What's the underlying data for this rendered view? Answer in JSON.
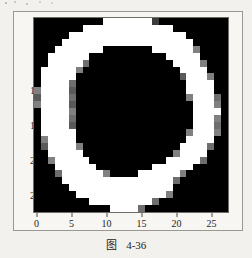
{
  "figure": {
    "caption_symbol": "图",
    "caption_number": "4-36"
  },
  "chart_data": {
    "type": "heatmap",
    "title": "",
    "xlabel": "",
    "ylabel": "",
    "xlim": [
      -0.5,
      27.5
    ],
    "ylim": [
      27.5,
      -0.5
    ],
    "grid": false,
    "legend": "none",
    "colormap": "gray",
    "vmin": 0,
    "vmax": 255,
    "rows": 28,
    "cols": 28,
    "x_ticks": [
      0,
      5,
      10,
      15,
      20,
      25
    ],
    "y_ticks": [
      0,
      5,
      10,
      15,
      20,
      25
    ],
    "x_tick_labels": [
      "0",
      "5",
      "10",
      "15",
      "20",
      "25"
    ],
    "y_tick_labels": [
      "0",
      "5",
      "10",
      "15",
      "20",
      "25"
    ],
    "values": [
      [
        0,
        0,
        0,
        0,
        0,
        0,
        0,
        0,
        0,
        0,
        255,
        255,
        255,
        255,
        255,
        255,
        255,
        60,
        0,
        0,
        0,
        0,
        0,
        0,
        0,
        0,
        0,
        0
      ],
      [
        0,
        0,
        0,
        0,
        0,
        0,
        0,
        255,
        255,
        255,
        255,
        255,
        255,
        255,
        255,
        255,
        255,
        255,
        255,
        255,
        0,
        0,
        0,
        0,
        0,
        0,
        0,
        0
      ],
      [
        0,
        0,
        0,
        0,
        0,
        255,
        255,
        255,
        255,
        255,
        255,
        255,
        255,
        255,
        255,
        255,
        255,
        255,
        255,
        255,
        255,
        255,
        0,
        0,
        0,
        0,
        0,
        0
      ],
      [
        0,
        0,
        0,
        0,
        255,
        255,
        255,
        255,
        255,
        255,
        255,
        255,
        255,
        255,
        255,
        255,
        255,
        255,
        255,
        255,
        255,
        255,
        255,
        0,
        0,
        0,
        0,
        0
      ],
      [
        0,
        0,
        0,
        255,
        255,
        255,
        255,
        255,
        255,
        255,
        0,
        0,
        0,
        0,
        0,
        0,
        0,
        255,
        255,
        255,
        255,
        255,
        255,
        128,
        0,
        0,
        0,
        0
      ],
      [
        0,
        0,
        255,
        255,
        255,
        255,
        255,
        255,
        0,
        0,
        0,
        0,
        0,
        0,
        0,
        0,
        0,
        0,
        0,
        255,
        255,
        255,
        255,
        255,
        0,
        0,
        0,
        0
      ],
      [
        0,
        0,
        255,
        255,
        255,
        255,
        255,
        110,
        0,
        0,
        0,
        0,
        0,
        0,
        0,
        0,
        0,
        0,
        0,
        0,
        255,
        255,
        255,
        255,
        128,
        0,
        0,
        0
      ],
      [
        0,
        255,
        255,
        255,
        255,
        255,
        128,
        0,
        0,
        0,
        0,
        0,
        0,
        0,
        0,
        0,
        0,
        0,
        0,
        0,
        0,
        255,
        255,
        255,
        255,
        0,
        0,
        0
      ],
      [
        0,
        255,
        255,
        255,
        255,
        255,
        0,
        0,
        0,
        0,
        0,
        0,
        0,
        0,
        0,
        0,
        0,
        0,
        0,
        0,
        0,
        90,
        255,
        255,
        255,
        128,
        0,
        0
      ],
      [
        0,
        255,
        255,
        255,
        255,
        110,
        0,
        0,
        0,
        0,
        0,
        0,
        0,
        0,
        0,
        0,
        0,
        0,
        0,
        0,
        0,
        0,
        255,
        255,
        255,
        255,
        0,
        0
      ],
      [
        128,
        255,
        255,
        255,
        255,
        90,
        0,
        0,
        0,
        0,
        0,
        0,
        0,
        0,
        0,
        0,
        0,
        0,
        0,
        0,
        0,
        0,
        255,
        255,
        255,
        255,
        0,
        0
      ],
      [
        90,
        255,
        255,
        255,
        255,
        110,
        0,
        0,
        0,
        0,
        0,
        0,
        0,
        0,
        0,
        0,
        0,
        0,
        0,
        0,
        0,
        0,
        128,
        255,
        255,
        255,
        110,
        0
      ],
      [
        128,
        255,
        255,
        255,
        255,
        90,
        0,
        0,
        0,
        0,
        0,
        0,
        0,
        0,
        0,
        0,
        0,
        0,
        0,
        0,
        0,
        0,
        0,
        255,
        255,
        255,
        128,
        0
      ],
      [
        0,
        255,
        255,
        255,
        255,
        128,
        0,
        0,
        0,
        0,
        0,
        0,
        0,
        0,
        0,
        0,
        0,
        0,
        0,
        0,
        0,
        0,
        0,
        255,
        255,
        255,
        255,
        0
      ],
      [
        0,
        255,
        255,
        255,
        255,
        110,
        0,
        0,
        0,
        0,
        0,
        0,
        0,
        0,
        0,
        0,
        0,
        0,
        0,
        0,
        0,
        0,
        0,
        255,
        255,
        255,
        128,
        0
      ],
      [
        0,
        255,
        255,
        255,
        255,
        90,
        0,
        0,
        0,
        0,
        0,
        0,
        0,
        0,
        0,
        0,
        0,
        0,
        0,
        0,
        0,
        0,
        0,
        255,
        255,
        255,
        110,
        0
      ],
      [
        0,
        255,
        255,
        255,
        255,
        255,
        0,
        0,
        0,
        0,
        0,
        0,
        0,
        0,
        0,
        0,
        0,
        0,
        0,
        0,
        0,
        0,
        128,
        255,
        255,
        255,
        128,
        0
      ],
      [
        0,
        128,
        255,
        255,
        255,
        255,
        0,
        0,
        0,
        0,
        0,
        0,
        0,
        0,
        0,
        0,
        0,
        0,
        0,
        0,
        0,
        0,
        255,
        255,
        255,
        255,
        0,
        0
      ],
      [
        0,
        90,
        255,
        255,
        255,
        255,
        128,
        0,
        0,
        0,
        0,
        0,
        0,
        0,
        0,
        0,
        0,
        0,
        0,
        0,
        0,
        255,
        255,
        255,
        255,
        110,
        0,
        0
      ],
      [
        0,
        0,
        255,
        255,
        255,
        255,
        255,
        0,
        0,
        0,
        0,
        0,
        0,
        0,
        0,
        0,
        0,
        0,
        0,
        0,
        128,
        255,
        255,
        255,
        255,
        0,
        0,
        0
      ],
      [
        0,
        0,
        128,
        255,
        255,
        255,
        255,
        255,
        0,
        0,
        0,
        0,
        0,
        0,
        0,
        0,
        0,
        0,
        0,
        255,
        255,
        255,
        255,
        255,
        110,
        0,
        0,
        0
      ],
      [
        0,
        0,
        0,
        255,
        255,
        255,
        255,
        255,
        255,
        0,
        0,
        0,
        0,
        0,
        0,
        0,
        0,
        255,
        255,
        255,
        255,
        255,
        255,
        0,
        0,
        0,
        0,
        0
      ],
      [
        0,
        0,
        0,
        110,
        255,
        255,
        255,
        255,
        255,
        255,
        128,
        0,
        0,
        0,
        0,
        255,
        255,
        255,
        255,
        255,
        255,
        128,
        0,
        0,
        0,
        0,
        0,
        0
      ],
      [
        0,
        0,
        0,
        0,
        255,
        255,
        255,
        255,
        255,
        255,
        255,
        255,
        255,
        255,
        255,
        255,
        255,
        255,
        255,
        255,
        110,
        0,
        0,
        0,
        0,
        0,
        0,
        0
      ],
      [
        0,
        0,
        0,
        0,
        0,
        255,
        255,
        255,
        255,
        255,
        255,
        255,
        255,
        255,
        255,
        255,
        255,
        255,
        255,
        255,
        0,
        0,
        0,
        0,
        0,
        0,
        0,
        0
      ],
      [
        0,
        0,
        0,
        0,
        0,
        0,
        255,
        255,
        255,
        255,
        255,
        255,
        255,
        255,
        255,
        255,
        255,
        255,
        255,
        128,
        0,
        0,
        0,
        0,
        0,
        0,
        0,
        0
      ],
      [
        0,
        0,
        0,
        0,
        0,
        0,
        0,
        0,
        255,
        255,
        255,
        255,
        255,
        255,
        255,
        255,
        255,
        110,
        0,
        0,
        0,
        0,
        0,
        0,
        0,
        0,
        0,
        0
      ],
      [
        0,
        0,
        0,
        0,
        0,
        0,
        0,
        0,
        0,
        0,
        0,
        255,
        255,
        255,
        255,
        110,
        0,
        0,
        0,
        0,
        0,
        0,
        0,
        0,
        0,
        0,
        0,
        0
      ]
    ]
  }
}
